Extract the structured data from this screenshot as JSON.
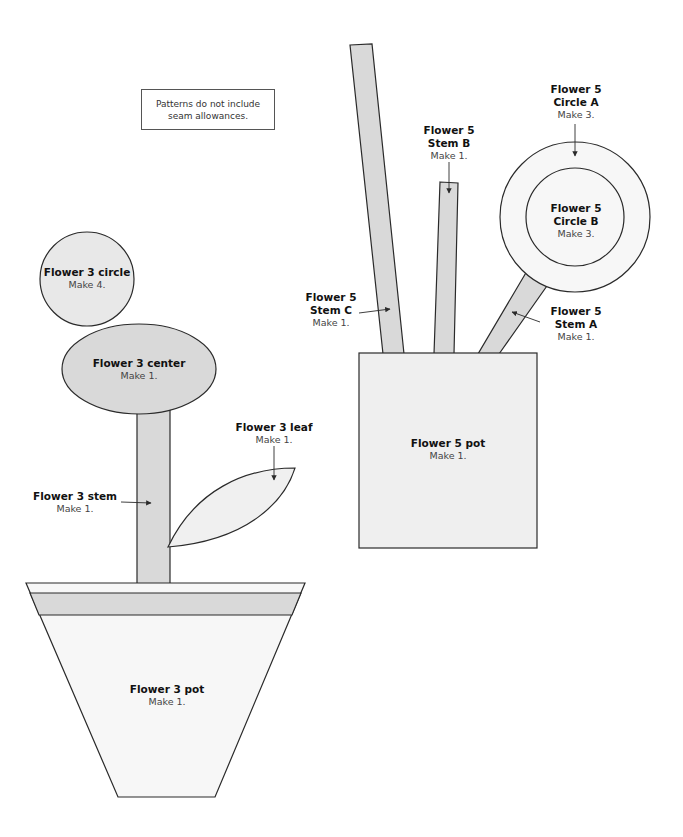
{
  "colors": {
    "outline": "#2a2a2a",
    "fill_medium": "#d9d9d9",
    "fill_light": "#f0f0f0",
    "fill_white": "#f7f7f7",
    "text_title": "#111111",
    "text_sub": "#444444"
  },
  "note": {
    "line1": "Patterns do not include",
    "line2": "seam allowances."
  },
  "flower3": {
    "circle": {
      "title": "Flower 3 circle",
      "make": "Make 4."
    },
    "center": {
      "title": "Flower 3 center",
      "make": "Make 1."
    },
    "stem": {
      "title": "Flower 3 stem",
      "make": "Make 1."
    },
    "leaf": {
      "title": "Flower 3 leaf",
      "make": "Make 1."
    },
    "pot": {
      "title": "Flower 3 pot",
      "make": "Make 1."
    }
  },
  "flower5": {
    "circle_a": {
      "title1": "Flower 5",
      "title2": "Circle A",
      "make": "Make 3."
    },
    "circle_b": {
      "title1": "Flower 5",
      "title2": "Circle B",
      "make": "Make 3."
    },
    "stem_a": {
      "title1": "Flower 5",
      "title2": "Stem A",
      "make": "Make 1."
    },
    "stem_b": {
      "title1": "Flower 5",
      "title2": "Stem B",
      "make": "Make 1."
    },
    "stem_c": {
      "title1": "Flower 5",
      "title2": "Stem C",
      "make": "Make 1."
    },
    "pot": {
      "title": "Flower 5 pot",
      "make": "Make 1."
    }
  }
}
